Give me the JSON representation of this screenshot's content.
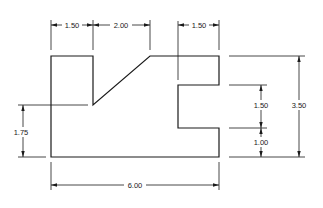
{
  "drawing": {
    "type": "orthographic-view-with-dimensions",
    "units": "inches",
    "dimensions": {
      "top_left_width": "1.50",
      "top_slope_width": "2.00",
      "top_right_width": "1.50",
      "left_height": "1.75",
      "slot_height": "1.50",
      "slot_bottom_height": "1.00",
      "overall_height": "3.50",
      "overall_width": "6.00"
    },
    "colors": {
      "line": "#1a1a1a",
      "background": "#ffffff"
    }
  }
}
